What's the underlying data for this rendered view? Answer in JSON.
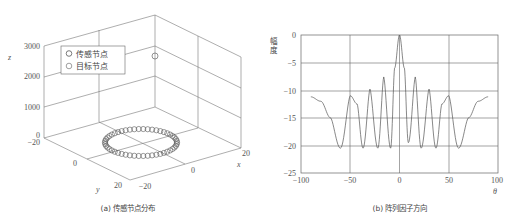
{
  "chart_data": [
    {
      "type": "scatter",
      "subtype": "3d",
      "caption": "(a) 传感节点分布",
      "xlabel": "x",
      "ylabel": "y",
      "zlabel": "z",
      "xlim": [
        -20,
        20
      ],
      "ylim": [
        -20,
        20
      ],
      "zlim": [
        0,
        3000
      ],
      "xticks": [
        "-20",
        "0",
        "20"
      ],
      "yticks": [
        "-20",
        "0",
        "20"
      ],
      "zticks": [
        "0",
        "1000",
        "2000",
        "3000"
      ],
      "legend": [
        "传感节点",
        "目标节点"
      ],
      "legend_position": "upper-left",
      "series": [
        {
          "name": "传感节点",
          "shape": "uniform circular ring",
          "center": [
            0,
            0,
            0
          ],
          "radius": 10,
          "count": 50,
          "z": 0
        },
        {
          "name": "目标节点",
          "points": [
            [
              0,
              0,
              2500
            ]
          ]
        }
      ]
    },
    {
      "type": "line",
      "caption": "(b) 阵列因子方向",
      "xlabel": "θ",
      "ylabel": "幅度",
      "xlim": [
        -100,
        100
      ],
      "ylim": [
        -25,
        0
      ],
      "xticks": [
        "-100",
        "-50",
        "0",
        "50",
        "100"
      ],
      "yticks": [
        "0",
        "-5",
        "-10",
        "-15",
        "-20",
        "-25"
      ],
      "grid": true,
      "x": [
        -90,
        -80,
        -70,
        -60,
        -50,
        -43,
        -37,
        -30,
        -22,
        -16,
        -9,
        -5,
        0,
        5,
        9,
        16,
        22,
        30,
        37,
        43,
        50,
        60,
        70,
        80,
        90
      ],
      "values": [
        -11.2,
        -12,
        -15,
        -20.5,
        -11,
        -12.5,
        -20.5,
        -9.8,
        -20.5,
        -7.6,
        -20.5,
        -6,
        0,
        -6,
        -19.5,
        -7.6,
        -20.5,
        -9.8,
        -20.5,
        -12.5,
        -11,
        -20.5,
        -15,
        -12,
        -11.2
      ],
      "main_lobe": {
        "theta": 0,
        "value": 0
      },
      "sidelobes": [
        {
          "theta": -50,
          "value": -11
        },
        {
          "theta": -30,
          "value": -9.8
        },
        {
          "theta": -16,
          "value": -7.6
        },
        {
          "theta": 16,
          "value": -7.6
        },
        {
          "theta": 30,
          "value": -9.8
        },
        {
          "theta": 50,
          "value": -11
        }
      ],
      "nulls_theta": [
        -60,
        -37,
        -22,
        -9,
        9,
        22,
        37,
        60
      ]
    }
  ],
  "left": {
    "caption": "(a) 传感节点分布",
    "legend": {
      "item1": "传感节点",
      "item2": "目标节点"
    },
    "z_ticks": [
      "3000",
      "2000",
      "1000",
      "0"
    ],
    "y_ticks": [
      "−20",
      "0",
      "20"
    ],
    "x_ticks": [
      "−20",
      "0",
      "20"
    ],
    "x_label": "x",
    "y_label": "y",
    "z_label": "z"
  },
  "right": {
    "caption": "(b) 阵列因子方向",
    "y_label": "幅度",
    "x_label": "θ",
    "y_ticks": [
      "0",
      "−5",
      "−10",
      "−15",
      "−20",
      "−25"
    ],
    "x_ticks": [
      "−100",
      "−50",
      "0",
      "50",
      "100"
    ]
  }
}
